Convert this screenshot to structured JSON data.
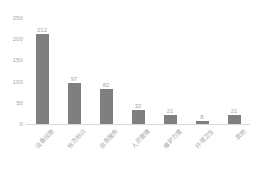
{
  "chart_data": {
    "type": "bar",
    "title": "",
    "subtitle": "",
    "xlabel": "",
    "ylabel": "",
    "ylim": [
      0,
      250
    ],
    "yticks": [
      0,
      50,
      100,
      150,
      200,
      250
    ],
    "ytick_labels": [
      "0",
      "50",
      "100",
      "150",
      "200",
      "250"
    ],
    "grid": false,
    "legend": false,
    "legend_position": "none",
    "bar_color": "#7f7f7f",
    "label_color": "#a6a6a6",
    "axis_color": "#d9d9d9",
    "label_rotation_degrees": -45,
    "categories": [
      "设备设施",
      "标志标识",
      "信息服务",
      "人员管理",
      "维护力度",
      "环境卫生",
      "其他"
    ],
    "values": [
      212,
      97,
      82,
      32,
      21,
      8,
      21
    ],
    "value_labels": [
      "212",
      "97",
      "82",
      "32",
      "21",
      "8",
      "21"
    ],
    "series": [
      {
        "name": "数量",
        "values": [
          212,
          97,
          82,
          32,
          21,
          8,
          21
        ]
      }
    ]
  }
}
